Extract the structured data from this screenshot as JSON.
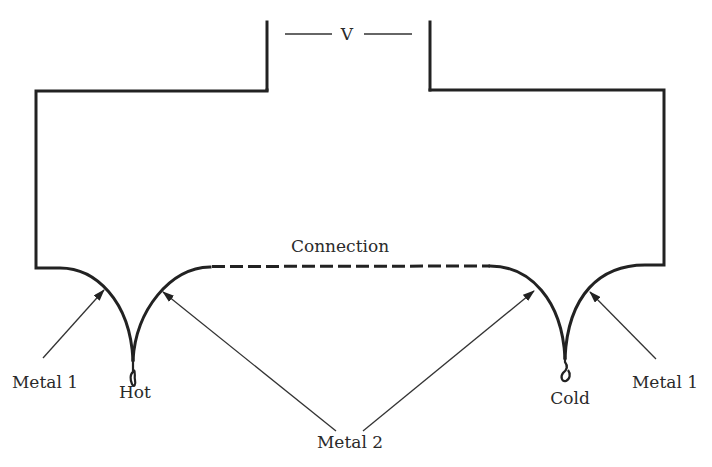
{
  "diagram": {
    "type": "thermocouple-circuit",
    "labels": {
      "voltage": "V",
      "connection": "Connection",
      "hot": "Hot",
      "cold": "Cold",
      "metal1_left": "Metal 1",
      "metal1_right": "Metal 1",
      "metal2": "Metal 2"
    },
    "colors": {
      "line": "#222222",
      "text": "#2a2a2a",
      "background": "#ffffff"
    }
  }
}
